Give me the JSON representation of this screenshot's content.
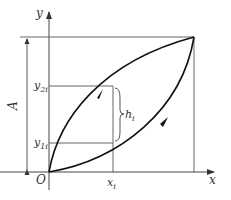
{
  "diagram": {
    "axes": {
      "x_label": "x",
      "y_label": "y",
      "origin_label": "O"
    },
    "labels": {
      "amplitude": "A",
      "y2i": {
        "base": "y",
        "sub": "2i"
      },
      "y1i": {
        "base": "y",
        "sub": "1i"
      },
      "xi": {
        "base": "x",
        "sub": "i"
      },
      "hi": {
        "base": "h",
        "sub": "i"
      }
    },
    "curves": [
      {
        "name": "loading-curve",
        "direction": "up",
        "shape": "lower-convex"
      },
      {
        "name": "unloading-curve",
        "direction": "down",
        "shape": "upper-concave"
      }
    ],
    "colors": {
      "curve": "#111111",
      "guide": "#555555",
      "text": "#333333"
    }
  }
}
